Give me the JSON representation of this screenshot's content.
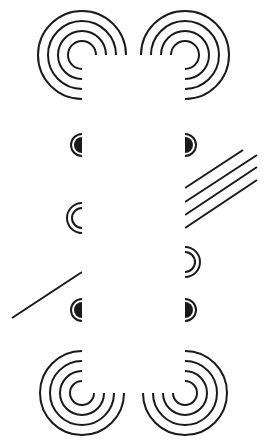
{
  "canvas": {
    "width": 267,
    "height": 447,
    "background": "#ffffff",
    "ink": "#1a1a1a"
  },
  "band": {
    "x": 82,
    "y": 57,
    "width": 103,
    "height": 336,
    "color": "#ffffff"
  },
  "spirals": [
    {
      "name": "spiral-top-left",
      "cx": 82,
      "cy": 55,
      "radii": [
        14,
        24,
        34,
        44
      ],
      "orientation": "top"
    },
    {
      "name": "spiral-top-right",
      "cx": 185,
      "cy": 55,
      "radii": [
        14,
        24,
        34,
        44
      ],
      "orientation": "top"
    },
    {
      "name": "spiral-bottom-left",
      "cx": 82,
      "cy": 393,
      "radii": [
        12,
        22,
        32,
        42
      ],
      "orientation": "bottom"
    },
    {
      "name": "spiral-bottom-right",
      "cx": 185,
      "cy": 393,
      "radii": [
        12,
        22,
        32,
        42
      ],
      "orientation": "bottom"
    }
  ],
  "half_discs": [
    {
      "name": "half-disc-left-upper",
      "cx": 82,
      "cy": 145,
      "r": 11,
      "side": "left"
    },
    {
      "name": "half-disc-right-upper",
      "cx": 185,
      "cy": 145,
      "r": 11,
      "side": "right"
    },
    {
      "name": "half-disc-left-lower",
      "cx": 82,
      "cy": 310,
      "r": 11,
      "side": "left"
    },
    {
      "name": "half-disc-right-lower",
      "cx": 185,
      "cy": 310,
      "r": 11,
      "side": "right"
    }
  ],
  "small_arcs": [
    {
      "name": "double-arc-left",
      "cx": 82,
      "cy": 218,
      "radii": [
        10,
        15
      ],
      "side": "left"
    },
    {
      "name": "double-arc-right",
      "cx": 185,
      "cy": 262,
      "radii": [
        10,
        15
      ],
      "side": "right"
    }
  ],
  "lines": [
    {
      "name": "diagonal-line-1",
      "x1": 185,
      "y1": 188,
      "x2": 243,
      "y2": 150
    },
    {
      "name": "diagonal-line-2",
      "x1": 185,
      "y1": 202,
      "x2": 257,
      "y2": 155
    },
    {
      "name": "diagonal-line-3",
      "x1": 185,
      "y1": 215,
      "x2": 257,
      "y2": 167
    },
    {
      "name": "diagonal-line-4",
      "x1": 185,
      "y1": 228,
      "x2": 257,
      "y2": 180
    },
    {
      "name": "diagonal-line-5",
      "x1": 82,
      "y1": 272,
      "x2": 12,
      "y2": 318
    }
  ]
}
